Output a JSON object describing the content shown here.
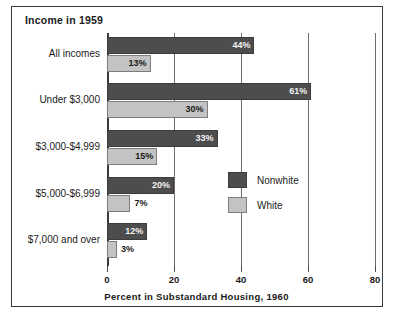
{
  "chart_data": {
    "type": "bar",
    "orientation": "horizontal",
    "title": "Income in 1959",
    "xlabel": "Percent in Substandard Housing, 1960",
    "ylabel": "",
    "xlim": [
      0,
      80
    ],
    "xticks": [
      0,
      20,
      40,
      60,
      80
    ],
    "xtick_labels": [
      "0",
      "20",
      "40",
      "60",
      "80"
    ],
    "grid": "vertical",
    "legend_position": "center-right-inside",
    "categories": [
      "All incomes",
      "Under $3,000",
      "$3,000-$4,999",
      "$5,000-$6,999",
      "$7,000 and over"
    ],
    "series": [
      {
        "name": "Nonwhite",
        "color": "#4d4d4d",
        "values": [
          44,
          61,
          33,
          20,
          12
        ],
        "value_labels": [
          "44%",
          "61%",
          "33%",
          "20%",
          "12%"
        ]
      },
      {
        "name": "White",
        "color": "#c3c3c3",
        "values": [
          13,
          30,
          15,
          7,
          3
        ],
        "value_labels": [
          "13%",
          "30%",
          "15%",
          "7%",
          "3%"
        ]
      }
    ]
  },
  "legend": {
    "items": [
      {
        "label": "Nonwhite",
        "color": "#4d4d4d"
      },
      {
        "label": "White",
        "color": "#c3c3c3"
      }
    ]
  }
}
